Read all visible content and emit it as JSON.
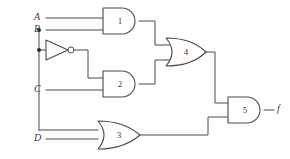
{
  "diagram": {
    "type": "logic-circuit",
    "background_color": "#ffffff",
    "line_color": "#4a4a4a",
    "text_color": "#3a3a3a",
    "width": 290,
    "height": 159
  },
  "inputs": [
    {
      "label": "A",
      "x": 38,
      "y": 18
    },
    {
      "label": "B",
      "x": 38,
      "y": 30
    },
    {
      "label": "C",
      "x": 38,
      "y": 90
    },
    {
      "label": "D",
      "x": 38,
      "y": 139
    }
  ],
  "outputs": [
    {
      "label": "f",
      "x": 277,
      "y": 110
    }
  ],
  "gates": [
    {
      "id": "1",
      "label": "1",
      "type": "AND",
      "cx": 120,
      "cy": 21,
      "inputs": [
        "A",
        "B"
      ],
      "output_to": "4"
    },
    {
      "id": "2",
      "label": "2",
      "type": "AND",
      "cx": 120,
      "cy": 84,
      "inputs": [
        "NOT B",
        "C"
      ],
      "output_to": "4"
    },
    {
      "id": "3",
      "label": "3",
      "type": "OR",
      "cx": 120,
      "cy": 135,
      "inputs": [
        "B",
        "D"
      ],
      "output_to": "5"
    },
    {
      "id": "4",
      "label": "4",
      "type": "OR",
      "cx": 187,
      "cy": 52,
      "inputs": [
        "1",
        "2"
      ],
      "output_to": "5"
    },
    {
      "id": "5",
      "label": "5",
      "type": "AND",
      "cx": 245,
      "cy": 110,
      "inputs": [
        "4",
        "3"
      ],
      "output_to": "f"
    }
  ],
  "inverters": [
    {
      "id": "inv1",
      "type": "NOT",
      "input": "B",
      "output_to": "2",
      "cx": 57,
      "cy": 50
    }
  ],
  "junctions": [
    {
      "on": "B",
      "x": 39,
      "y": 30
    },
    {
      "on": "B",
      "x": 39,
      "y": 50
    }
  ],
  "icons": {
    "and_gate": "and-gate-icon",
    "or_gate": "or-gate-icon",
    "not_gate": "not-gate-icon",
    "junction_dot": "junction-dot-icon"
  }
}
